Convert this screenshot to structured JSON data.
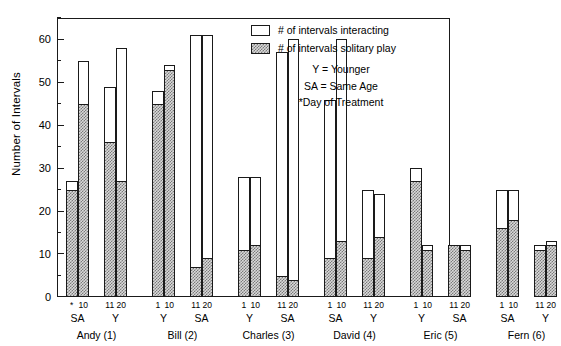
{
  "chart_data": {
    "type": "bar",
    "title": "",
    "subtitle": "",
    "xlabel": "",
    "ylabel": "Number of Intervals",
    "ylim": [
      0,
      65
    ],
    "y_ticks_major": [
      0,
      10,
      20,
      30,
      40,
      50,
      60
    ],
    "y_ticks_minor": [
      5,
      15,
      25,
      35,
      45,
      55,
      65
    ],
    "grid": false,
    "legend_position": "top-right",
    "series": [
      {
        "name": "# of intervals interacting",
        "fill": "open"
      },
      {
        "name": "# of intervals solitary play",
        "fill": "hatched"
      }
    ],
    "groups": [
      {
        "subject": "Andy (1)",
        "blocks": [
          {
            "age": "SA",
            "bars": [
              {
                "day": "*",
                "day_full": "1",
                "interacting": 27,
                "solitary": 25
              },
              {
                "day": "10",
                "interacting": 55,
                "solitary": 45
              }
            ]
          },
          {
            "age": "Y",
            "bars": [
              {
                "day": "11",
                "interacting": 49,
                "solitary": 36
              },
              {
                "day": "20",
                "interacting": 58,
                "solitary": 27
              }
            ]
          }
        ]
      },
      {
        "subject": "Bill (2)",
        "blocks": [
          {
            "age": "Y",
            "bars": [
              {
                "day": "1",
                "interacting": 48,
                "solitary": 45
              },
              {
                "day": "10",
                "interacting": 54,
                "solitary": 53
              }
            ]
          },
          {
            "age": "SA",
            "bars": [
              {
                "day": "11",
                "interacting": 61,
                "solitary": 7
              },
              {
                "day": "20",
                "interacting": 61,
                "solitary": 9
              }
            ]
          }
        ]
      },
      {
        "subject": "Charles (3)",
        "blocks": [
          {
            "age": "Y",
            "bars": [
              {
                "day": "1",
                "interacting": 28,
                "solitary": 11
              },
              {
                "day": "10",
                "interacting": 28,
                "solitary": 12
              }
            ]
          },
          {
            "age": "SA",
            "bars": [
              {
                "day": "11",
                "interacting": 57,
                "solitary": 5
              },
              {
                "day": "20",
                "interacting": 60,
                "solitary": 4
              }
            ]
          }
        ]
      },
      {
        "subject": "David (4)",
        "blocks": [
          {
            "age": "SA",
            "bars": [
              {
                "day": "1",
                "interacting": 46,
                "solitary": 9
              },
              {
                "day": "10",
                "interacting": 60,
                "solitary": 13
              }
            ]
          },
          {
            "age": "Y",
            "bars": [
              {
                "day": "11",
                "interacting": 25,
                "solitary": 9
              },
              {
                "day": "20",
                "interacting": 24,
                "solitary": 14
              }
            ]
          }
        ]
      },
      {
        "subject": "Eric (5)",
        "blocks": [
          {
            "age": "Y",
            "bars": [
              {
                "day": "1",
                "interacting": 30,
                "solitary": 27
              },
              {
                "day": "10",
                "interacting": 12,
                "solitary": 11
              }
            ]
          },
          {
            "age": "SA",
            "bars": [
              {
                "day": "11",
                "interacting": 12,
                "solitary": 12
              },
              {
                "day": "20",
                "interacting": 12,
                "solitary": 11
              }
            ]
          }
        ]
      },
      {
        "subject": "Fern (6)",
        "blocks": [
          {
            "age": "SA",
            "bars": [
              {
                "day": "1",
                "interacting": 25,
                "solitary": 16
              },
              {
                "day": "10",
                "interacting": 25,
                "solitary": 18
              }
            ]
          },
          {
            "age": "Y",
            "bars": [
              {
                "day": "11",
                "interacting": 12,
                "solitary": 11
              },
              {
                "day": "20",
                "interacting": 13,
                "solitary": 12
              }
            ]
          }
        ]
      }
    ]
  },
  "legend": {
    "items": [
      {
        "label": "# of intervals interacting",
        "fill": "open"
      },
      {
        "label": "# of intervals solitary play",
        "fill": "hatched"
      }
    ],
    "notes": [
      "Y = Younger",
      "SA = Same Age",
      "*Day of Treatment"
    ]
  }
}
